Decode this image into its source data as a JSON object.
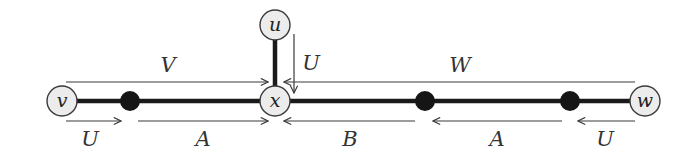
{
  "diagram": {
    "nodes": [
      {
        "id": "v",
        "label": "v",
        "kind": "labeled"
      },
      {
        "id": "u",
        "label": "u",
        "kind": "labeled"
      },
      {
        "id": "x",
        "label": "x",
        "kind": "labeled"
      },
      {
        "id": "w",
        "label": "w",
        "kind": "labeled"
      },
      {
        "id": "p1",
        "label": "",
        "kind": "black-dot"
      },
      {
        "id": "p2",
        "label": "",
        "kind": "black-dot"
      },
      {
        "id": "p3",
        "label": "",
        "kind": "black-dot"
      }
    ],
    "edges": [
      {
        "from": "v",
        "to": "p1"
      },
      {
        "from": "p1",
        "to": "x"
      },
      {
        "from": "x",
        "to": "p2"
      },
      {
        "from": "p2",
        "to": "p3"
      },
      {
        "from": "p3",
        "to": "w"
      },
      {
        "from": "u",
        "to": "x"
      }
    ],
    "arrows": [
      {
        "id": "V",
        "label": "V",
        "from": "v",
        "to": "x",
        "side": "above"
      },
      {
        "id": "W",
        "label": "W",
        "from": "w",
        "to": "x",
        "side": "above"
      },
      {
        "id": "U-top",
        "label": "U",
        "from": "u",
        "to": "x",
        "side": "right"
      },
      {
        "id": "U-left",
        "label": "U",
        "from": "v",
        "to": "p1",
        "side": "below"
      },
      {
        "id": "A-left",
        "label": "A",
        "from": "p1",
        "to": "x",
        "side": "below"
      },
      {
        "id": "B",
        "label": "B",
        "from": "p2",
        "to": "x",
        "side": "below"
      },
      {
        "id": "A-right",
        "label": "A",
        "from": "p3",
        "to": "p2",
        "side": "below"
      },
      {
        "id": "U-right",
        "label": "U",
        "from": "w",
        "to": "p3",
        "side": "below"
      }
    ]
  }
}
